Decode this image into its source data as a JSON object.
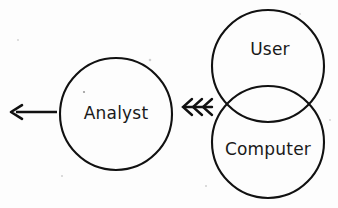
{
  "diagram": {
    "title": "Analyst receives information from overlapping User and Computer domains",
    "background_color": "#fdfdfd",
    "stroke_color": "#111111",
    "text_color": "#1a1a1a",
    "nodes": [
      {
        "id": "analyst",
        "label": "Analyst",
        "shape": "circle",
        "cx": 116,
        "cy": 114,
        "r": 56,
        "label_x": 116,
        "label_y": 114
      },
      {
        "id": "user",
        "label": "User",
        "shape": "circle",
        "cx": 268,
        "cy": 66,
        "r": 56,
        "label_x": 270,
        "label_y": 50
      },
      {
        "id": "computer",
        "label": "Computer",
        "shape": "circle",
        "cx": 268,
        "cy": 142,
        "r": 56,
        "label_x": 268,
        "label_y": 150
      }
    ],
    "connectors": [
      {
        "id": "output-arrow",
        "kind": "arrow-left",
        "from_x": 57,
        "to_x": 11,
        "y": 112,
        "head_size": 11
      },
      {
        "id": "input-triple-chevron",
        "kind": "triple-chevron-left",
        "x": 183,
        "y": 107,
        "count": 3,
        "spacing": 10,
        "height": 16
      }
    ]
  }
}
